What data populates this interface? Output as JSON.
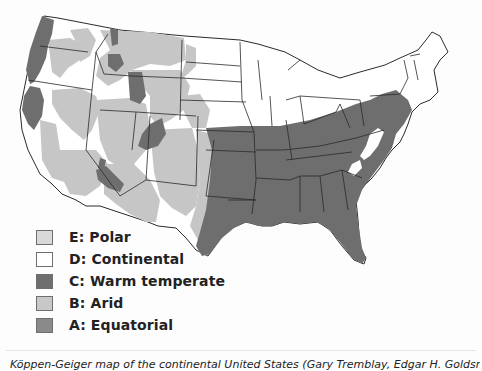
{
  "figure": {
    "type": "climate-map",
    "region": "Continental United States",
    "caption": "Köppen-Geiger map of the continental United States (Gary Tremblay, Edgar H. Goldsmith, illustrator)"
  },
  "legend": {
    "items": [
      {
        "code": "E",
        "label": "E: Polar",
        "color": "#d9d9d9"
      },
      {
        "code": "D",
        "label": "D: Continental",
        "color": "#ffffff"
      },
      {
        "code": "C",
        "label": "C: Warm temperate",
        "color": "#6e6e6e"
      },
      {
        "code": "B",
        "label": "B: Arid",
        "color": "#c8c8c8"
      },
      {
        "code": "A",
        "label": "A: Equatorial",
        "color": "#8a8a8a"
      }
    ]
  },
  "colors": {
    "state_border": "#2a2a2a",
    "warm_temperate": "#6e6e6e",
    "arid": "#c6c6c6",
    "continental": "#ffffff"
  }
}
